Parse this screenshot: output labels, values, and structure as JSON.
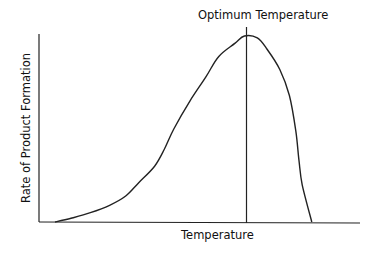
{
  "chart_data": {
    "type": "line",
    "title": "Optimum Temperature",
    "xlabel": "Temperature",
    "ylabel": "Rate of Product Formation",
    "grid": false,
    "legend": null,
    "ticks": {
      "x": [],
      "y": []
    },
    "annotations": [
      {
        "type": "vline",
        "label": "Optimum Temperature",
        "x_relative": 0.64
      }
    ],
    "series": [
      {
        "name": "Rate of Product Formation",
        "points_relative": [
          [
            0.05,
            0.0
          ],
          [
            0.1,
            0.02
          ],
          [
            0.16,
            0.05
          ],
          [
            0.22,
            0.09
          ],
          [
            0.27,
            0.14
          ],
          [
            0.31,
            0.21
          ],
          [
            0.36,
            0.3
          ],
          [
            0.39,
            0.39
          ],
          [
            0.42,
            0.5
          ],
          [
            0.47,
            0.65
          ],
          [
            0.52,
            0.78
          ],
          [
            0.56,
            0.89
          ],
          [
            0.61,
            0.96
          ],
          [
            0.64,
            1.0
          ],
          [
            0.68,
            0.99
          ],
          [
            0.71,
            0.93
          ],
          [
            0.75,
            0.82
          ],
          [
            0.78,
            0.68
          ],
          [
            0.8,
            0.49
          ],
          [
            0.81,
            0.33
          ],
          [
            0.82,
            0.2
          ],
          [
            0.85,
            0.0
          ]
        ]
      }
    ],
    "xlim": [
      0,
      1
    ],
    "ylim": [
      0,
      1
    ]
  },
  "colors": {
    "line": "#111111",
    "background": "#ffffff"
  }
}
